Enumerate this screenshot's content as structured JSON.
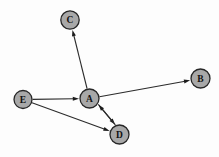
{
  "figure": {
    "background_color": "#fdfdfd",
    "width": 219,
    "height": 157
  },
  "style": {
    "node_fill": "#a8a8a8",
    "node_stroke": "#262626",
    "edge_color": "#2b2b2b",
    "arrow_color": "#1c1c1c",
    "label_color": "#111111",
    "node_radius": 9.5
  },
  "chart_data": {
    "type": "diagram",
    "graph_type": "directed",
    "title": "",
    "nodes": [
      {
        "id": "C",
        "label": "C",
        "x": 70.0,
        "y": 20.0,
        "r": 9.2
      },
      {
        "id": "B",
        "label": "B",
        "x": 200.5,
        "y": 78.5,
        "r": 9.5
      },
      {
        "id": "E",
        "label": "E",
        "x": 23.0,
        "y": 99.5,
        "r": 9.0
      },
      {
        "id": "A",
        "label": "A",
        "x": 89.5,
        "y": 98.5,
        "r": 9.5
      },
      {
        "id": "D",
        "label": "D",
        "x": 119.5,
        "y": 134.5,
        "r": 9.5
      }
    ],
    "edges": [
      {
        "id": "edge-a-c",
        "from": "A",
        "to": "C",
        "directed": true,
        "arrow_at": "to"
      },
      {
        "id": "edge-a-b",
        "from": "A",
        "to": "B",
        "directed": true,
        "arrow_at": "to"
      },
      {
        "id": "edge-e-a",
        "from": "E",
        "to": "A",
        "directed": true,
        "arrow_at": "to"
      },
      {
        "id": "edge-e-d",
        "from": "E",
        "to": "D",
        "directed": true,
        "arrow_at": "to"
      },
      {
        "id": "edge-a-d",
        "from": "A",
        "to": "D",
        "directed": true,
        "arrow_at": "to"
      },
      {
        "id": "edge-d-a",
        "from": "D",
        "to": "A",
        "directed": true,
        "arrow_at": "to"
      }
    ],
    "node_count": 5,
    "edge_count": 6,
    "legend": [],
    "annotations": []
  }
}
